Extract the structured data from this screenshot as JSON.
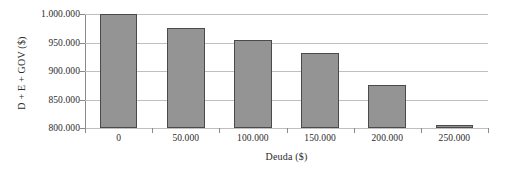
{
  "chart_data": {
    "type": "bar",
    "title": "",
    "subtitle": "",
    "xlabel": "Deuda ($)",
    "ylabel": "D + E + GOV ($)",
    "categories": [
      "0",
      "50.000",
      "100.000",
      "150.000",
      "200.000",
      "250.000"
    ],
    "values": [
      1000000,
      975000,
      955000,
      932000,
      876000,
      805000
    ],
    "series": [
      {
        "name": "D + E + GOV ($)",
        "values": [
          1000000,
          975000,
          955000,
          932000,
          876000,
          805000
        ]
      }
    ],
    "ylim": [
      800000,
      1000000
    ],
    "ytick_labels": [
      "1.000.000",
      "950.000",
      "900.000",
      "850.000",
      "800.000"
    ],
    "ytick_values": [
      1000000,
      950000,
      900000,
      850000,
      800000
    ],
    "xtick_labels": [
      "0",
      "50.000",
      "100.000",
      "150.000",
      "200.000",
      "250.000"
    ],
    "grid": true,
    "grid_axis": "y",
    "legend": false,
    "legend_position": "none",
    "bar_color": "#949494",
    "bar_edge_color": "#4a4a4a",
    "grid_color": "#bfbfbf",
    "axis_color": "#8a8a8a",
    "text_color": "#2b2b2b",
    "background": "#ffffff"
  }
}
